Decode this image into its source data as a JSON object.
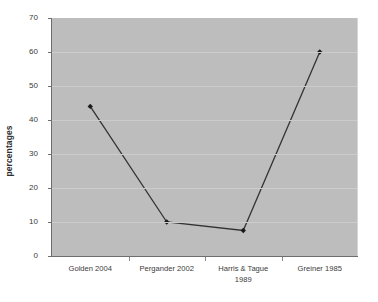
{
  "chart_data": {
    "type": "line",
    "title": "",
    "xlabel": "",
    "ylabel": "percentages",
    "categories": [
      "Golden 2004",
      "Pergander 2002",
      "Harris & Tague 1989",
      "Greiner 1985"
    ],
    "values": [
      44,
      10,
      7.5,
      60
    ],
    "ylim": [
      0,
      70
    ],
    "ytick_step": 10,
    "yticks": [
      "70",
      "60",
      "50",
      "40",
      "30",
      "20",
      "10",
      "0"
    ],
    "grid": true,
    "legend": "none",
    "series": [
      {
        "name": "percentages",
        "values": [
          44,
          10,
          7.5,
          60
        ]
      }
    ],
    "marker": "diamond",
    "colors": {
      "plot_background": "#bdbdbd",
      "page_background": "#ffffff",
      "gridline": "#cccccc",
      "axis": "#6e6e6e",
      "series_line": "#333333",
      "marker": "#1a1a1a",
      "text": "#3b3b3b"
    }
  },
  "axes": {
    "y_title": "percentages"
  }
}
